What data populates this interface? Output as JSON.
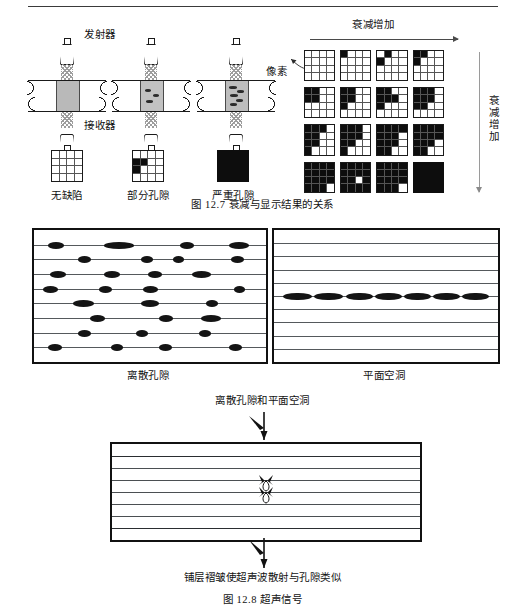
{
  "page": {
    "fig127": {
      "caption": "图 12.7   衰减与显示结果的关系",
      "labels": {
        "transmitter": "发射器",
        "receiver": "接收器",
        "pixel": "像素",
        "attenuation_h": "衰减增加",
        "attenuation_v": "衰减增加"
      },
      "legend": [
        {
          "name": "无缺陷",
          "kind": "grid",
          "pattern": []
        },
        {
          "name": "部分孔隙",
          "kind": "grid",
          "pattern": [
            [
              1,
              0
            ],
            [
              1,
              1
            ],
            [
              2,
              0
            ]
          ]
        },
        {
          "name": "严重孔隙",
          "kind": "solid"
        }
      ],
      "matrix_rows": 4,
      "matrix_cols": 4,
      "matrix": [
        [
          {
            "on": []
          },
          {
            "on": [
              [
                0,
                0
              ]
            ]
          },
          {
            "on": [
              [
                0,
                1
              ],
              [
                1,
                0
              ]
            ]
          },
          {
            "on": [
              [
                0,
                0
              ],
              [
                0,
                1
              ],
              [
                1,
                0
              ]
            ]
          }
        ],
        [
          {
            "on": [
              [
                0,
                0
              ],
              [
                0,
                1
              ],
              [
                1,
                0
              ],
              [
                1,
                1
              ]
            ]
          },
          {
            "on": [
              [
                0,
                0
              ],
              [
                0,
                1
              ],
              [
                1,
                0
              ],
              [
                1,
                1
              ],
              [
                2,
                0
              ]
            ]
          },
          {
            "on": [
              [
                0,
                0
              ],
              [
                0,
                1
              ],
              [
                1,
                0
              ],
              [
                1,
                1
              ],
              [
                2,
                0
              ],
              [
                1,
                2
              ]
            ]
          },
          {
            "on": [
              [
                0,
                0
              ],
              [
                0,
                1
              ],
              [
                0,
                2
              ],
              [
                1,
                0
              ],
              [
                1,
                1
              ],
              [
                1,
                2
              ],
              [
                2,
                0
              ],
              [
                2,
                1
              ]
            ]
          }
        ],
        [
          {
            "on": [
              [
                0,
                0
              ],
              [
                0,
                1
              ],
              [
                0,
                2
              ],
              [
                1,
                0
              ],
              [
                1,
                1
              ],
              [
                2,
                0
              ],
              [
                2,
                1
              ],
              [
                3,
                0
              ]
            ]
          },
          {
            "on": [
              [
                0,
                0
              ],
              [
                0,
                1
              ],
              [
                0,
                2
              ],
              [
                1,
                0
              ],
              [
                1,
                1
              ],
              [
                1,
                2
              ],
              [
                2,
                0
              ],
              [
                2,
                1
              ],
              [
                3,
                0
              ]
            ]
          },
          {
            "on": [
              [
                0,
                0
              ],
              [
                0,
                1
              ],
              [
                0,
                2
              ],
              [
                0,
                3
              ],
              [
                1,
                0
              ],
              [
                1,
                1
              ],
              [
                1,
                2
              ],
              [
                2,
                0
              ],
              [
                2,
                1
              ],
              [
                2,
                2
              ],
              [
                3,
                0
              ],
              [
                3,
                1
              ]
            ]
          },
          {
            "on": [
              [
                0,
                0
              ],
              [
                0,
                1
              ],
              [
                0,
                2
              ],
              [
                0,
                3
              ],
              [
                1,
                0
              ],
              [
                1,
                1
              ],
              [
                1,
                2
              ],
              [
                1,
                3
              ],
              [
                2,
                0
              ],
              [
                2,
                1
              ],
              [
                2,
                2
              ],
              [
                3,
                0
              ],
              [
                3,
                1
              ]
            ]
          }
        ],
        [
          {
            "on": [
              [
                0,
                0
              ],
              [
                0,
                1
              ],
              [
                0,
                2
              ],
              [
                0,
                3
              ],
              [
                1,
                0
              ],
              [
                1,
                1
              ],
              [
                1,
                2
              ],
              [
                1,
                3
              ],
              [
                2,
                0
              ],
              [
                2,
                1
              ],
              [
                2,
                2
              ],
              [
                2,
                3
              ],
              [
                3,
                0
              ],
              [
                3,
                1
              ],
              [
                3,
                2
              ]
            ]
          },
          {
            "on": [
              [
                0,
                0
              ],
              [
                0,
                1
              ],
              [
                0,
                2
              ],
              [
                0,
                3
              ],
              [
                1,
                0
              ],
              [
                1,
                1
              ],
              [
                1,
                2
              ],
              [
                1,
                3
              ],
              [
                2,
                0
              ],
              [
                2,
                1
              ],
              [
                2,
                3
              ],
              [
                3,
                0
              ],
              [
                3,
                1
              ],
              [
                3,
                2
              ],
              [
                3,
                3
              ]
            ]
          },
          {
            "on": [
              [
                0,
                0
              ],
              [
                0,
                1
              ],
              [
                0,
                2
              ],
              [
                0,
                3
              ],
              [
                1,
                0
              ],
              [
                1,
                1
              ],
              [
                1,
                2
              ],
              [
                1,
                3
              ],
              [
                2,
                0
              ],
              [
                2,
                1
              ],
              [
                2,
                2
              ],
              [
                2,
                3
              ],
              [
                3,
                0
              ],
              [
                3,
                1
              ],
              [
                3,
                2
              ]
            ]
          },
          {
            "on": [
              [
                0,
                0
              ],
              [
                0,
                1
              ],
              [
                0,
                2
              ],
              [
                0,
                3
              ],
              [
                1,
                0
              ],
              [
                1,
                1
              ],
              [
                1,
                2
              ],
              [
                1,
                3
              ],
              [
                2,
                0
              ],
              [
                2,
                1
              ],
              [
                2,
                2
              ],
              [
                2,
                3
              ],
              [
                3,
                0
              ],
              [
                3,
                1
              ],
              [
                3,
                2
              ],
              [
                3,
                3
              ]
            ]
          }
        ]
      ]
    },
    "fig128": {
      "caption": "图 12.8   超声信号",
      "left_panel_caption": "离散孔隙",
      "right_panel_caption": "平面空洞",
      "mid_annotation": "离散孔隙和平面空洞",
      "bottom_annotation": "铺层褶皱使超声波散射与孔隙类似",
      "ply_lines_left": 8,
      "ply_lines_right": 9,
      "laminate_lines": 7
    },
    "colors": {
      "ink": "#111111",
      "line": "#55595c",
      "pore": "#141414",
      "grid_line": "#555555",
      "plate_fill": "#b9b9b9",
      "arrow": "#4a4a4a",
      "arrow_light": "#9a9a9a"
    }
  }
}
